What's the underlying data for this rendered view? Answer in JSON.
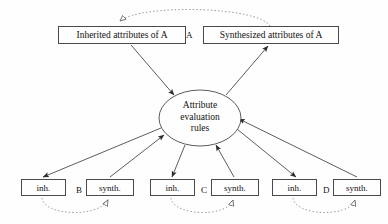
{
  "diagram": {
    "background_color": "#fefefe",
    "stroke_color": "#4a4a4a",
    "dotted_stroke_color": "#8a8a8a",
    "text_color": "#111111"
  },
  "top_nodes": [
    {
      "id": "inherited-a",
      "label": "Inherited attributes of  A",
      "x": 58,
      "y": 26,
      "width": 128,
      "height": 18
    },
    {
      "id": "synthesized-a",
      "label": "Synthesized attributes of  A",
      "x": 203,
      "y": 26,
      "width": 136,
      "height": 18
    }
  ],
  "top_separator_label": {
    "id": "symbol-a",
    "label": "A",
    "x": 186,
    "y": 30
  },
  "center_node": {
    "id": "attribute-evaluation-rules",
    "lines": [
      "Attribute",
      "evaluation",
      "rules"
    ],
    "cx": 200,
    "cy": 118,
    "rx": 41,
    "ry": 28
  },
  "leaf_groups": [
    {
      "symbol": "B",
      "symbol_x": 76,
      "symbol_y": 185,
      "inh": {
        "id": "inh-b",
        "label": "inh.",
        "x": 21,
        "y": 179,
        "width": 45,
        "height": 17
      },
      "synth": {
        "id": "synth-b",
        "label": "synth.",
        "x": 86,
        "y": 179,
        "width": 48,
        "height": 17
      }
    },
    {
      "symbol": "C",
      "symbol_x": 201,
      "symbol_y": 185,
      "inh": {
        "id": "inh-c",
        "label": "inh.",
        "x": 150,
        "y": 179,
        "width": 45,
        "height": 17
      },
      "synth": {
        "id": "synth-c",
        "label": "synth.",
        "x": 211,
        "y": 179,
        "width": 48,
        "height": 17
      }
    },
    {
      "symbol": "D",
      "symbol_x": 323,
      "symbol_y": 185,
      "inh": {
        "id": "inh-d",
        "label": "inh.",
        "x": 272,
        "y": 179,
        "width": 45,
        "height": 17
      },
      "synth": {
        "id": "synth-d",
        "label": "synth.",
        "x": 333,
        "y": 179,
        "width": 48,
        "height": 17
      }
    }
  ],
  "edges": {
    "solid": [
      {
        "id": "edge-inherited-a-to-rules",
        "from": "inherited-a",
        "to": "attribute-evaluation-rules",
        "x1": 131,
        "y1": 45,
        "x2": 174,
        "y2": 95,
        "arrow": "filled-triangle"
      },
      {
        "id": "edge-rules-to-synthesized-a",
        "from": "attribute-evaluation-rules",
        "to": "synthesized-a",
        "x1": 226,
        "y1": 95,
        "x2": 268,
        "y2": 46,
        "arrow": "filled-triangle"
      },
      {
        "id": "edge-rules-to-inh-b",
        "from": "attribute-evaluation-rules",
        "to": "inh-b",
        "x1": 161,
        "y1": 128,
        "x2": 43,
        "y2": 177,
        "arrow": "filled-triangle"
      },
      {
        "id": "edge-synth-b-to-rules",
        "from": "synth-b",
        "to": "attribute-evaluation-rules",
        "x1": 110,
        "y1": 177,
        "x2": 164,
        "y2": 135,
        "arrow": "filled-triangle"
      },
      {
        "id": "edge-rules-to-inh-c",
        "from": "attribute-evaluation-rules",
        "to": "inh-c",
        "x1": 185,
        "y1": 145,
        "x2": 172,
        "y2": 177,
        "arrow": "filled-triangle"
      },
      {
        "id": "edge-synth-c-to-rules",
        "from": "synth-c",
        "to": "attribute-evaluation-rules",
        "x1": 234,
        "y1": 177,
        "x2": 216,
        "y2": 145,
        "arrow": "filled-triangle"
      },
      {
        "id": "edge-rules-to-inh-d",
        "from": "attribute-evaluation-rules",
        "to": "inh-d",
        "x1": 237,
        "y1": 129,
        "x2": 296,
        "y2": 177,
        "arrow": "filled-triangle"
      },
      {
        "id": "edge-synth-d-to-rules",
        "from": "synth-d",
        "to": "attribute-evaluation-rules",
        "x1": 357,
        "y1": 177,
        "x2": 239,
        "y2": 119,
        "arrow": "filled-triangle"
      }
    ],
    "dotted": [
      {
        "id": "dotted-arc-a",
        "from": "synthesized-a",
        "to": "inherited-a",
        "path": "M 270 26 C 258 6, 140 4, 120 21",
        "arrow": "open-triangle"
      },
      {
        "id": "dotted-arc-b",
        "from": "inh-b",
        "to": "synth-b",
        "path": "M 42 198 C 44 216, 98 218, 108 200",
        "arrow": "open-triangle"
      },
      {
        "id": "dotted-arc-c",
        "from": "inh-c",
        "to": "synth-c",
        "path": "M 171 198 C 173 216, 227 218, 233 200",
        "arrow": "open-triangle"
      },
      {
        "id": "dotted-arc-d",
        "from": "inh-d",
        "to": "synth-d",
        "path": "M 293 198 C 295 216, 349 218, 355 200",
        "arrow": "open-triangle"
      }
    ]
  }
}
